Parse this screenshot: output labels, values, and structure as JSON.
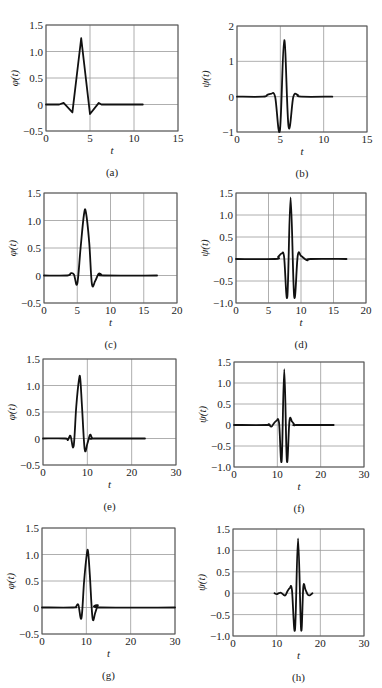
{
  "chart_data": [
    {
      "id": "a",
      "type": "line",
      "caption": "(a)",
      "xlabel": "t",
      "ylabel": "φ(t)",
      "xlim": [
        0,
        15
      ],
      "ylim": [
        -0.5,
        1.5
      ],
      "xticks": [
        0,
        5,
        10,
        15
      ],
      "yticks": [
        -0.5,
        0,
        0.5,
        1.0,
        1.5
      ],
      "xtick_labels": [
        "0",
        "5",
        "10",
        "15"
      ],
      "ytick_labels": [
        "−0.5",
        "0",
        "0.5",
        "1.0",
        "1.5"
      ],
      "grid": true,
      "frame": {
        "x": 46,
        "y": 25,
        "w": 132,
        "h": 106
      },
      "series": [
        {
          "name": "phi",
          "x": [
            0,
            1.5,
            2,
            3,
            4,
            5,
            6,
            6.3,
            7,
            11
          ],
          "y": [
            0,
            0,
            0.03,
            -0.15,
            1.25,
            -0.18,
            0.03,
            0.0,
            0,
            0
          ]
        }
      ]
    },
    {
      "id": "b",
      "type": "line",
      "caption": "(b)",
      "xlabel": "t",
      "ylabel": "ψ(t)",
      "xlim": [
        0,
        15
      ],
      "ylim": [
        -1,
        2
      ],
      "xticks": [
        0,
        5,
        10,
        15
      ],
      "yticks": [
        -1,
        0,
        1,
        2
      ],
      "xtick_labels": [
        "0",
        "5",
        "10",
        "15"
      ],
      "ytick_labels": [
        "−1",
        "0",
        "1",
        "2"
      ],
      "grid": true,
      "frame": {
        "x": 237,
        "y": 26,
        "w": 130,
        "h": 106
      },
      "series": [
        {
          "name": "psi",
          "x": [
            0,
            3,
            3.5,
            3.9,
            4.4,
            4.95,
            5.45,
            5.95,
            6.5,
            7,
            7.4,
            11
          ],
          "y": [
            0,
            0,
            0.05,
            0.08,
            0.0,
            -0.95,
            1.6,
            -0.85,
            0.0,
            0.05,
            0.0,
            0
          ]
        }
      ]
    },
    {
      "id": "c",
      "type": "line",
      "caption": "(c)",
      "xlabel": "t",
      "ylabel": "φ(t)",
      "xlim": [
        0,
        20
      ],
      "ylim": [
        -0.5,
        1.5
      ],
      "xticks": [
        0,
        5,
        10,
        15,
        20
      ],
      "yticks": [
        -0.5,
        0,
        0.5,
        1.0,
        1.5
      ],
      "xtick_labels": [
        "0",
        "5",
        "10",
        "15",
        "20"
      ],
      "ytick_labels": [
        "−0.5",
        "0",
        "0.5",
        "1.0",
        "1.5"
      ],
      "grid": true,
      "frame": {
        "x": 44,
        "y": 193,
        "w": 133,
        "h": 110
      },
      "series": [
        {
          "name": "phi",
          "x": [
            0,
            3.5,
            4,
            4.5,
            5,
            5.5,
            6,
            6.3,
            6.8,
            7.2,
            7.7,
            8.2,
            8.6,
            9,
            17
          ],
          "y": [
            0,
            0,
            0.04,
            0.02,
            -0.15,
            0.5,
            1.1,
            1.15,
            0.6,
            -0.15,
            -0.1,
            0.03,
            0.02,
            0,
            0
          ]
        }
      ]
    },
    {
      "id": "d",
      "type": "line",
      "caption": "(d)",
      "xlabel": "t",
      "ylabel": "ψ(t)",
      "xlim": [
        0,
        20
      ],
      "ylim": [
        -1.0,
        1.5
      ],
      "xticks": [
        0,
        5,
        10,
        15,
        20
      ],
      "yticks": [
        -1.0,
        -0.5,
        0,
        0.5,
        1.0,
        1.5
      ],
      "xtick_labels": [
        "0",
        "5",
        "10",
        "15",
        "20"
      ],
      "ytick_labels": [
        "−1.0",
        "−0.5",
        "0",
        "0.5",
        "1.0",
        "1.5"
      ],
      "grid": true,
      "frame": {
        "x": 236,
        "y": 193,
        "w": 130,
        "h": 110
      },
      "series": [
        {
          "name": "psi",
          "x": [
            0,
            6,
            6.5,
            7,
            7.4,
            7.9,
            8.4,
            8.95,
            9.5,
            10,
            10.6,
            11,
            11.5,
            17
          ],
          "y": [
            0,
            0,
            0.05,
            0.12,
            0.05,
            -0.85,
            1.4,
            -0.85,
            0.08,
            0.07,
            0.0,
            -0.03,
            0,
            0
          ]
        }
      ]
    },
    {
      "id": "e",
      "type": "line",
      "caption": "(e)",
      "xlabel": "t",
      "ylabel": "φ(t)",
      "xlim": [
        0,
        30
      ],
      "ylim": [
        -0.5,
        1.5
      ],
      "xticks": [
        0,
        10,
        20,
        30
      ],
      "yticks": [
        -0.5,
        0,
        0.5,
        1.0,
        1.5
      ],
      "xtick_labels": [
        "0",
        "10",
        "20",
        "30"
      ],
      "ytick_labels": [
        "−0.5",
        "0",
        "0.5",
        "1.0",
        "1.5"
      ],
      "grid": true,
      "frame": {
        "x": 43,
        "y": 359,
        "w": 133,
        "h": 106
      },
      "series": [
        {
          "name": "phi",
          "x": [
            0,
            5,
            5.6,
            6.2,
            6.9,
            7.5,
            8.1,
            8.4,
            8.8,
            9.4,
            10.0,
            10.6,
            11.1,
            11.6,
            23
          ],
          "y": [
            0,
            0,
            -0.03,
            0.05,
            -0.15,
            0.6,
            1.1,
            1.13,
            0.6,
            -0.2,
            -0.1,
            0.07,
            0.0,
            0,
            0
          ]
        }
      ]
    },
    {
      "id": "f",
      "type": "line",
      "caption": "(f)",
      "xlabel": "t",
      "ylabel": "ψ(t)",
      "xlim": [
        0,
        30
      ],
      "ylim": [
        -1.0,
        1.5
      ],
      "xticks": [
        0,
        10,
        20,
        30
      ],
      "yticks": [
        -1.0,
        -0.5,
        0,
        0.5,
        1.0,
        1.5
      ],
      "xtick_labels": [
        "0",
        "10",
        "20",
        "30"
      ],
      "ytick_labels": [
        "−1.0",
        "−0.5",
        "0",
        "0.5",
        "1.0",
        "1.5"
      ],
      "grid": true,
      "frame": {
        "x": 234,
        "y": 362,
        "w": 130,
        "h": 105
      },
      "series": [
        {
          "name": "psi",
          "x": [
            0,
            7.5,
            8,
            8.6,
            9.2,
            9.8,
            10.4,
            11.0,
            11.6,
            12.2,
            12.8,
            13.4,
            14,
            14.5,
            23
          ],
          "y": [
            0,
            0,
            0.02,
            -0.04,
            0.04,
            0.1,
            0.05,
            -0.85,
            1.33,
            -0.85,
            0.1,
            0.08,
            0.0,
            0,
            0
          ]
        }
      ]
    },
    {
      "id": "g",
      "type": "line",
      "caption": "(g)",
      "xlabel": "t",
      "ylabel": "φ(t)",
      "xlim": [
        0,
        30
      ],
      "ylim": [
        -0.5,
        1.5
      ],
      "xticks": [
        0,
        10,
        20,
        30
      ],
      "yticks": [
        -0.5,
        0,
        0.5,
        1.0,
        1.5
      ],
      "xtick_labels": [
        "0",
        "10",
        "20",
        "30"
      ],
      "ytick_labels": [
        "−0.5",
        "0",
        "0.5",
        "1.0",
        "1.5"
      ],
      "grid": true,
      "frame": {
        "x": 42,
        "y": 528,
        "w": 133,
        "h": 106
      },
      "series": [
        {
          "name": "phi",
          "x": [
            0,
            7,
            7.6,
            8.2,
            8.9,
            9.5,
            10.1,
            10.4,
            10.8,
            11.4,
            12.0,
            12.6,
            13.2,
            30
          ],
          "y": [
            0,
            0,
            0.01,
            0.05,
            -0.2,
            0.5,
            1.0,
            1.05,
            0.6,
            -0.2,
            -0.1,
            0.04,
            0.0,
            0
          ]
        }
      ]
    },
    {
      "id": "h",
      "type": "line",
      "caption": "(h)",
      "xlabel": "t",
      "ylabel": "ψ(t)",
      "xlim": [
        0,
        30
      ],
      "ylim": [
        -1.0,
        1.5
      ],
      "xticks": [
        0,
        10,
        20,
        30
      ],
      "yticks": [
        -1.0,
        -0.5,
        0,
        0.5,
        1.0,
        1.5
      ],
      "xtick_labels": [
        "0",
        "10",
        "20",
        "30"
      ],
      "ytick_labels": [
        "−1.0",
        "−0.5",
        "0",
        "0.5",
        "1.0",
        "1.5"
      ],
      "grid": true,
      "frame": {
        "x": 233,
        "y": 529,
        "w": 131,
        "h": 107
      },
      "series": [
        {
          "name": "psi",
          "x": [
            9.5,
            10,
            10.5,
            11,
            11.5,
            12,
            12.5,
            13,
            13.5,
            14.2,
            14.9,
            15.6,
            16.1,
            16.6,
            17.1,
            17.6,
            18.2
          ],
          "y": [
            0,
            -0.02,
            0.0,
            0.01,
            -0.03,
            -0.05,
            0.05,
            0.12,
            0.08,
            -0.85,
            1.28,
            -0.85,
            0.15,
            0.08,
            -0.03,
            -0.05,
            0.0
          ]
        }
      ]
    }
  ]
}
